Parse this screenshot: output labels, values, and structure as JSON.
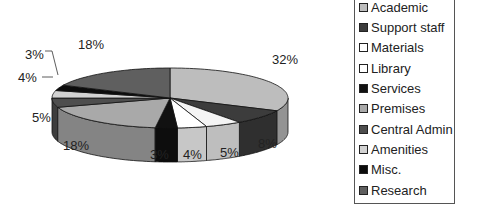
{
  "chart_data": {
    "type": "pie",
    "style": "3d",
    "title": "",
    "categories": [
      "Academic",
      "Support staff",
      "Materials",
      "Library",
      "Services",
      "Premises",
      "Central Admin",
      "Amenities",
      "Misc.",
      "Research"
    ],
    "values": [
      32,
      8,
      5,
      4,
      3,
      18,
      5,
      4,
      3,
      18
    ],
    "unit": "%",
    "legend_position": "right",
    "slice_colors": [
      "#bdbdbd",
      "#3c3c3c",
      "#f4f4f4",
      "#ffffff",
      "#111111",
      "#a9a9a9",
      "#4e4e4e",
      "#d2d2d2",
      "#0c0c0c",
      "#5f5f5f"
    ]
  },
  "labels": {
    "academic": "32%",
    "support_staff": "8%",
    "materials": "5%",
    "library": "4%",
    "services": "3%",
    "premises": "18%",
    "central_admin": "5%",
    "amenities": "4%",
    "misc": "3%",
    "research": "18%"
  },
  "legend": {
    "items": [
      {
        "label": "Academic",
        "color": "#bdbdbd"
      },
      {
        "label": "Support staff",
        "color": "#3c3c3c"
      },
      {
        "label": "Materials",
        "color": "#ffffff"
      },
      {
        "label": "Library",
        "color": "#ffffff"
      },
      {
        "label": "Services",
        "color": "#111111"
      },
      {
        "label": "Premises",
        "color": "#a9a9a9"
      },
      {
        "label": "Central Admin",
        "color": "#4e4e4e"
      },
      {
        "label": "Amenities",
        "color": "#d2d2d2"
      },
      {
        "label": "Misc.",
        "color": "#0c0c0c"
      },
      {
        "label": "Research",
        "color": "#5f5f5f"
      }
    ]
  }
}
